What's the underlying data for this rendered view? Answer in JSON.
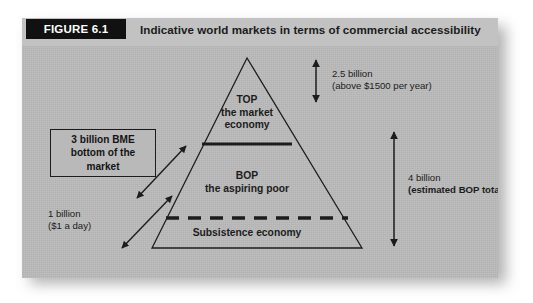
{
  "figure": {
    "tag": "FIGURE 6.1",
    "caption": "Indicative world markets in terms of commercial accessibility"
  },
  "pyramid": {
    "top": {
      "title": "TOP",
      "line2": "the market",
      "line3": "economy"
    },
    "middle": {
      "title": "BOP",
      "line2": "the aspiring poor"
    },
    "bottom": {
      "title": "Subsistence economy"
    }
  },
  "annotations": {
    "top_measure": {
      "value": "2.5 billion",
      "detail": "(above $1500 per year)"
    },
    "bop_measure": {
      "value": "4 billion",
      "detail": "(estimated BOP total)"
    },
    "subsistence_measure": {
      "value": "1 billion",
      "detail": "($1 a day)"
    },
    "callout": {
      "line1": "3 billion BME",
      "line2": "bottom of the",
      "line3": "market"
    }
  },
  "colors": {
    "panel_background": "#b9b9b9",
    "header_band": "#c2c2c2",
    "tag_background": "#111111",
    "tag_text": "#ffffff",
    "ink": "#1c1c1c"
  }
}
